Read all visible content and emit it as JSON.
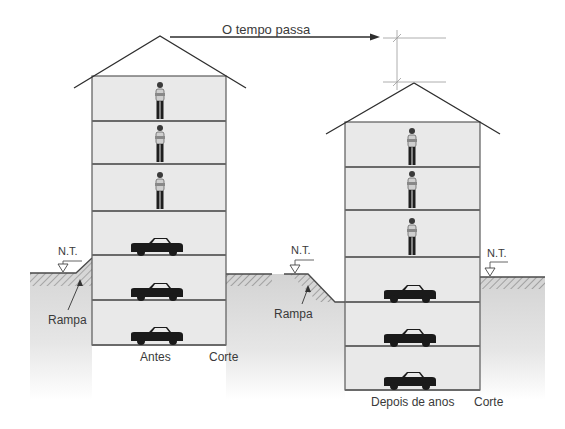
{
  "diagram": {
    "title_arrow_label": "O tempo passa",
    "ground_level_label": "N.T.",
    "ramp_label": "Rampa",
    "section_label": "Corte",
    "before": {
      "caption": "Antes",
      "floors": [
        {
          "level": 1,
          "occupant": "person"
        },
        {
          "level": 2,
          "occupant": "person"
        },
        {
          "level": 3,
          "occupant": "person"
        },
        {
          "level": 4,
          "occupant": "car"
        },
        {
          "level": 5,
          "occupant": "car"
        },
        {
          "level": 6,
          "occupant": "car"
        }
      ],
      "floors_above_ground": 4,
      "floors_below_ground": 2
    },
    "after": {
      "caption": "Depois de anos",
      "floors": [
        {
          "level": 1,
          "occupant": "person"
        },
        {
          "level": 2,
          "occupant": "person"
        },
        {
          "level": 3,
          "occupant": "person"
        },
        {
          "level": 4,
          "occupant": "car"
        },
        {
          "level": 5,
          "occupant": "car"
        },
        {
          "level": 6,
          "occupant": "car"
        }
      ],
      "floors_above_ground": 3,
      "floors_below_ground": 3
    },
    "colors": {
      "building_fill": "#e9e9e9",
      "ground_fill": "#d6d6d6",
      "line": "#4a4a4a",
      "car": "#1a1a1a"
    }
  }
}
